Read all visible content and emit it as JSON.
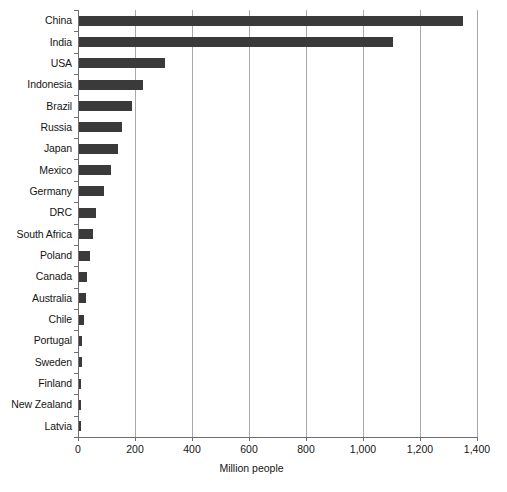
{
  "chart_data": {
    "type": "bar",
    "orientation": "horizontal",
    "title": "",
    "xlabel": "Million people",
    "ylabel": "",
    "xlim": [
      0,
      1400
    ],
    "xticks": [
      0,
      200,
      400,
      600,
      800,
      1000,
      1200,
      1400
    ],
    "xtick_labels": [
      "0",
      "200",
      "400",
      "600",
      "800",
      "1,000",
      "1,200",
      "1,400"
    ],
    "grid": "vertical",
    "legend": "none",
    "bar_color": "#3a3a3a",
    "categories": [
      "China",
      "India",
      "USA",
      "Indonesia",
      "Brazil",
      "Russia",
      "Japan",
      "Mexico",
      "Germany",
      "DRC",
      "South Africa",
      "Poland",
      "Canada",
      "Australia",
      "Chile",
      "Portugal",
      "Sweden",
      "Finland",
      "New Zealand",
      "Latvia"
    ],
    "values": [
      1347,
      1100,
      302,
      225,
      186,
      151,
      137,
      112,
      88,
      60,
      49,
      38,
      28,
      24,
      19,
      10,
      10,
      5.5,
      4.5,
      2
    ]
  }
}
